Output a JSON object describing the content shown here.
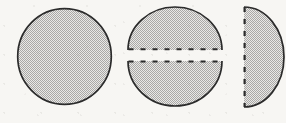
{
  "figure": {
    "background_color": "#f7f6f3",
    "outline_color": "#2b2b2b",
    "fill_color": "#c9c9c9",
    "fill_style": "halftone-checkerboard-gray",
    "panel_count": 3,
    "panels": [
      {
        "id": "panel-whole-disc",
        "label": "whole disc",
        "shape": "circle",
        "cut_edges": 0,
        "center_x": 64.5,
        "center_y": 56.5,
        "radius_x": 47.5,
        "radius_y": 48.5,
        "stroke_width": 1.6,
        "edge_style": "solid"
      },
      {
        "id": "panel-split-disc",
        "label": "disc split into upper and lower half-discs",
        "shape": "two-half-discs-horizontal",
        "cut_edges": 2,
        "center_x": 175,
        "top_half": {
          "id": "upper-half-disc",
          "label": "upper half-disc",
          "arc_top_y": 7,
          "cut_line_y": 50,
          "radius_x": 47,
          "radius_y": 43,
          "edge_style": "dashed",
          "arc_style": "solid"
        },
        "bottom_half": {
          "id": "lower-half-disc",
          "label": "lower half-disc",
          "cut_line_y": 61,
          "arc_bottom_y": 106,
          "radius_x": 47,
          "radius_y": 45,
          "edge_style": "dashed",
          "arc_style": "solid"
        },
        "gap_height": 11
      },
      {
        "id": "panel-right-half-disc",
        "label": "right half-disc with vertical cut edge",
        "shape": "half-disc-vertical",
        "cut_edges": 1,
        "cut_line_x": 244,
        "arc_right_x": 284,
        "top_y": 7,
        "bottom_y": 107,
        "radius_x": 40,
        "radius_y": 50,
        "edge_style": "dashed",
        "arc_style": "solid",
        "clipped_at_image_edge": true
      }
    ],
    "dash_pattern": {
      "dash_length": 5,
      "gap_length": 7,
      "stroke_width": 2.0
    }
  }
}
